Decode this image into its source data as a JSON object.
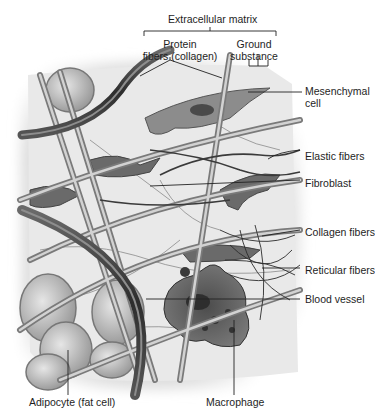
{
  "diagram": {
    "title": "Extracellular matrix",
    "subgroups": [
      {
        "label": "Protein\nfibers (collagen)"
      },
      {
        "label": "Ground\nsubstance"
      }
    ],
    "right_labels": [
      {
        "label": "Mesenchymal\ncell"
      },
      {
        "label": "Elastic fibers"
      },
      {
        "label": "Fibroblast"
      },
      {
        "label": "Collagen fibers"
      },
      {
        "label": "Reticular fibers"
      },
      {
        "label": "Blood vessel"
      }
    ],
    "bottom_labels": [
      {
        "label": "Adipocyte (fat cell)"
      },
      {
        "label": "Macrophage"
      }
    ],
    "colors": {
      "background": "#ffffff",
      "tissue_bg": "#e8e8e8",
      "fiber_dark": "#3a3a3a",
      "fiber_light": "#9a9a9a",
      "cell_fill": "#6e6e6e",
      "leader_line": "#222222"
    }
  }
}
